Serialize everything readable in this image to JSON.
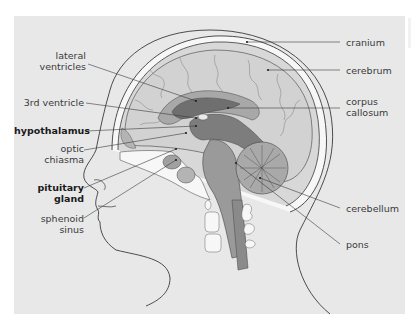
{
  "diagram": {
    "colors": {
      "panel_background": "#e8e8e8",
      "outline": "#3a3a3a",
      "brain_tissue": "#c9c9c9",
      "cortex_fill": "#d6d6d6",
      "ventricle_dark": "#6f6f6f",
      "mid_gray": "#9a9a9a",
      "bone_white": "#f7f7f7",
      "label_text": "#3a3a3a"
    },
    "labels_left": [
      {
        "id": "lateral-ventricles",
        "lines": [
          "lateral",
          "ventricles"
        ],
        "bold": false
      },
      {
        "id": "3rd-ventricle",
        "lines": [
          "3rd ventricle"
        ],
        "bold": false
      },
      {
        "id": "hypothalamus",
        "lines": [
          "hypothalamus"
        ],
        "bold": true
      },
      {
        "id": "optic-chiasma",
        "lines": [
          "optic",
          "chiasma"
        ],
        "bold": false
      },
      {
        "id": "pituitary-gland",
        "lines": [
          "pituitary",
          "gland"
        ],
        "bold": true
      },
      {
        "id": "sphenoid-sinus",
        "lines": [
          "sphenoid",
          "sinus"
        ],
        "bold": false
      }
    ],
    "labels_right": [
      {
        "id": "cranium",
        "lines": [
          "cranium"
        ],
        "bold": false
      },
      {
        "id": "cerebrum",
        "lines": [
          "cerebrum"
        ],
        "bold": false
      },
      {
        "id": "corpus-callosum",
        "lines": [
          "corpus",
          "callosum"
        ],
        "bold": false
      },
      {
        "id": "cerebellum",
        "lines": [
          "cerebellum"
        ],
        "bold": false
      },
      {
        "id": "pons",
        "lines": [
          "pons"
        ],
        "bold": false
      }
    ]
  }
}
